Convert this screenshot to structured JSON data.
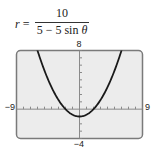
{
  "equation": {
    "lhs_var": "r",
    "equals": "=",
    "numerator": "10",
    "denominator_prefix": "5 − 5 sin ",
    "denominator_theta": "θ",
    "full_text": "r = 10 / (5 − 5 sin θ)"
  },
  "window": {
    "xmin_label": "−9",
    "xmax_label": "9",
    "ymin_label": "−4",
    "ymax_label": "8"
  },
  "colors": {
    "frame_fill": "#ececec",
    "frame_border": "#7a7a7a",
    "axis": "#8a8a8a",
    "curve": "#1a1a1a"
  },
  "chart_data": {
    "type": "line",
    "xlabel": "",
    "ylabel": "",
    "xlim": [
      -9,
      9
    ],
    "ylim": [
      -4,
      8
    ],
    "xscale_ticks": 1,
    "yscale_ticks": 1,
    "grid": false,
    "legend": null,
    "tick_labels": {
      "x": [
        "−9",
        "9"
      ],
      "y": [
        "−4",
        "8"
      ]
    },
    "annotations": [],
    "series": [
      {
        "name": "r = 10/(5 − 5 sin θ)",
        "x": [
          -6,
          -5,
          -4,
          -3,
          -2,
          -1,
          0,
          1,
          2,
          3,
          4,
          5,
          6
        ],
        "y": [
          8,
          5.25,
          3,
          1.25,
          0,
          -0.75,
          -1,
          -0.75,
          0,
          1.25,
          3,
          5.25,
          8
        ]
      }
    ]
  }
}
